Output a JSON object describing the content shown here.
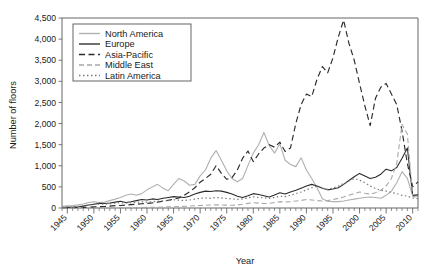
{
  "chart_data": {
    "type": "line",
    "title": "",
    "xlabel": "Year",
    "ylabel": "Number of floors",
    "xlim": [
      1944,
      2011
    ],
    "ylim": [
      0,
      4500
    ],
    "yticks": [
      "0",
      "500",
      "1,000",
      "1,500",
      "2,000",
      "2,500",
      "3,000",
      "3,500",
      "4,000",
      "4,500"
    ],
    "ytick_values": [
      0,
      500,
      1000,
      1500,
      2000,
      2500,
      3000,
      3500,
      4000,
      4500
    ],
    "xticks": [
      "1945",
      "1950",
      "1955",
      "1960",
      "1965",
      "1970",
      "1975",
      "1980",
      "1985",
      "1990",
      "1995",
      "2000",
      "2005",
      "2010"
    ],
    "xtick_values": [
      1945,
      1950,
      1955,
      1960,
      1965,
      1970,
      1975,
      1980,
      1985,
      1990,
      1995,
      2000,
      2005,
      2010
    ],
    "minor_tick_interval": 1,
    "grid": false,
    "legend_position": "upper-left-inside",
    "x": [
      1944,
      1945,
      1946,
      1947,
      1948,
      1949,
      1950,
      1951,
      1952,
      1953,
      1954,
      1955,
      1956,
      1957,
      1958,
      1959,
      1960,
      1961,
      1962,
      1963,
      1964,
      1965,
      1966,
      1967,
      1968,
      1969,
      1970,
      1971,
      1972,
      1973,
      1974,
      1975,
      1976,
      1977,
      1978,
      1979,
      1980,
      1981,
      1982,
      1983,
      1984,
      1985,
      1986,
      1987,
      1988,
      1989,
      1990,
      1991,
      1992,
      1993,
      1994,
      1995,
      1996,
      1997,
      1998,
      1999,
      2000,
      2001,
      2002,
      2003,
      2004,
      2005,
      2006,
      2007,
      2008,
      2009,
      2010,
      2011
    ],
    "series": [
      {
        "name": "North America",
        "color": "#b0b0b0",
        "dash": "none",
        "width": 1.1,
        "values": [
          40,
          50,
          60,
          75,
          95,
          130,
          150,
          130,
          140,
          175,
          210,
          250,
          300,
          330,
          300,
          340,
          430,
          500,
          560,
          470,
          410,
          560,
          700,
          640,
          540,
          560,
          760,
          900,
          1180,
          1360,
          1130,
          880,
          700,
          620,
          700,
          1010,
          1300,
          1500,
          1790,
          1480,
          1300,
          1520,
          1130,
          1030,
          980,
          1190,
          900,
          700,
          480,
          220,
          160,
          150,
          150,
          165,
          190,
          210,
          230,
          250,
          260,
          250,
          230,
          300,
          400,
          600,
          860,
          700,
          290,
          260
        ]
      },
      {
        "name": "Europe",
        "color": "#2b2b2b",
        "dash": "none",
        "width": 1.1,
        "values": [
          10,
          15,
          20,
          30,
          45,
          70,
          90,
          110,
          105,
          120,
          140,
          160,
          130,
          150,
          175,
          200,
          190,
          215,
          200,
          230,
          250,
          270,
          260,
          250,
          280,
          330,
          370,
          400,
          390,
          410,
          400,
          370,
          330,
          280,
          250,
          290,
          340,
          320,
          290,
          260,
          310,
          360,
          330,
          380,
          420,
          470,
          520,
          560,
          520,
          470,
          430,
          450,
          480,
          560,
          650,
          740,
          820,
          760,
          700,
          730,
          800,
          920,
          880,
          960,
          1180,
          1420,
          300,
          310
        ]
      },
      {
        "name": "Asia-Pacific",
        "color": "#2b2b2b",
        "dash": "6,3.5",
        "width": 1.15,
        "values": [
          5,
          8,
          10,
          12,
          15,
          20,
          25,
          30,
          35,
          45,
          55,
          60,
          70,
          80,
          90,
          100,
          110,
          120,
          140,
          160,
          185,
          210,
          240,
          300,
          380,
          480,
          610,
          700,
          800,
          1000,
          820,
          680,
          720,
          900,
          1180,
          1350,
          1100,
          1280,
          1420,
          1500,
          1440,
          1560,
          1340,
          1420,
          2000,
          2450,
          2700,
          2640,
          3050,
          3350,
          3200,
          3560,
          4050,
          4450,
          3900,
          3500,
          2950,
          2420,
          1950,
          2600,
          2860,
          2950,
          2700,
          2450,
          1820,
          1050,
          500,
          620
        ]
      },
      {
        "name": "Middle East",
        "color": "#a8a8a8",
        "dash": "5,3",
        "width": 1.1,
        "values": [
          0,
          0,
          0,
          0,
          0,
          0,
          0,
          0,
          0,
          2,
          3,
          5,
          6,
          8,
          10,
          12,
          14,
          16,
          18,
          22,
          26,
          30,
          34,
          40,
          46,
          52,
          58,
          64,
          70,
          78,
          72,
          68,
          64,
          72,
          88,
          110,
          125,
          115,
          105,
          110,
          130,
          150,
          140,
          150,
          165,
          180,
          200,
          190,
          175,
          165,
          175,
          200,
          230,
          260,
          300,
          340,
          380,
          350,
          330,
          360,
          420,
          520,
          700,
          1050,
          1980,
          1750,
          280,
          230
        ]
      },
      {
        "name": "Latin America",
        "color": "#7a7a7a",
        "dash": "1.5,2.5",
        "width": 1.2,
        "values": [
          20,
          25,
          30,
          40,
          55,
          70,
          85,
          95,
          90,
          100,
          115,
          125,
          115,
          120,
          135,
          145,
          140,
          150,
          160,
          170,
          180,
          195,
          185,
          180,
          190,
          210,
          230,
          240,
          230,
          250,
          240,
          225,
          215,
          205,
          215,
          240,
          265,
          250,
          240,
          230,
          250,
          280,
          270,
          300,
          340,
          380,
          430,
          480,
          520,
          470,
          440,
          470,
          520,
          580,
          640,
          700,
          660,
          600,
          520,
          460,
          420,
          400,
          370,
          340,
          300,
          280,
          240,
          220
        ]
      }
    ]
  },
  "legend": {
    "items": [
      {
        "label": "North America"
      },
      {
        "label": "Europe"
      },
      {
        "label": "Asia-Pacific"
      },
      {
        "label": "Middle East"
      },
      {
        "label": "Latin America"
      }
    ]
  }
}
